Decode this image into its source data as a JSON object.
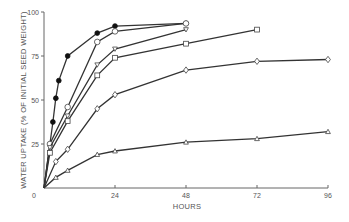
{
  "chart_data": {
    "type": "line",
    "title": "",
    "xlabel": "HOURS",
    "ylabel": "WATER UPTAKE (% OF INITIAL SEED WEIGHT)",
    "xlim": [
      0,
      96
    ],
    "ylim": [
      0,
      100
    ],
    "x_ticks": [
      0,
      24,
      48,
      72,
      96
    ],
    "y_ticks": [
      0,
      25,
      50,
      75,
      100
    ],
    "x_tick_labels": [
      "0",
      "24",
      "48",
      "72",
      "96"
    ],
    "y_tick_labels": [
      "0",
      "25",
      "50",
      "75",
      "100"
    ],
    "grid": false,
    "legend": "none",
    "series": [
      {
        "name": "filled-circle",
        "marker": "filled-circle",
        "x": [
          0,
          3,
          4,
          5,
          8,
          18,
          24,
          48
        ],
        "y": [
          0,
          37.5,
          51,
          61,
          75,
          88,
          92,
          93.5
        ]
      },
      {
        "name": "open-circle",
        "marker": "open-circle",
        "x": [
          0,
          2,
          8,
          18,
          24,
          48
        ],
        "y": [
          0,
          25,
          46,
          83,
          89,
          93.5
        ]
      },
      {
        "name": "down-triangle",
        "marker": "down-triangle",
        "x": [
          0,
          2,
          8,
          18,
          24,
          48
        ],
        "y": [
          0,
          23,
          41,
          70,
          79,
          90
        ]
      },
      {
        "name": "square",
        "marker": "square",
        "x": [
          0,
          2,
          8,
          18,
          24,
          48,
          72
        ],
        "y": [
          0,
          20,
          38,
          64,
          74,
          82,
          90
        ]
      },
      {
        "name": "diamond",
        "marker": "diamond",
        "x": [
          0,
          4,
          8,
          18,
          24,
          48,
          72,
          96
        ],
        "y": [
          0,
          15,
          22,
          45,
          53,
          67,
          72,
          73
        ]
      },
      {
        "name": "up-triangle",
        "marker": "up-triangle",
        "x": [
          0,
          4,
          8,
          18,
          24,
          48,
          72,
          96
        ],
        "y": [
          0,
          6,
          10,
          19,
          21,
          26,
          28,
          32
        ]
      }
    ]
  }
}
